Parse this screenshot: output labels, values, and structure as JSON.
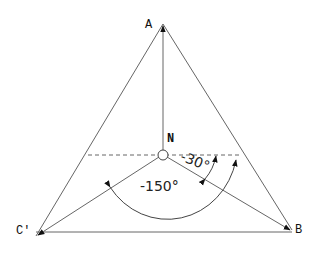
{
  "diagram": {
    "type": "vector-diagram",
    "points": {
      "A": {
        "label": "A",
        "x": 163,
        "y": 24
      },
      "B": {
        "label": "B",
        "x": 292,
        "y": 230
      },
      "C": {
        "label": "C'",
        "x": 36,
        "y": 236
      },
      "N": {
        "label": "N",
        "x": 163,
        "y": 155
      }
    },
    "angles": {
      "small": {
        "label": "-30°"
      },
      "large": {
        "label": "-150°"
      }
    },
    "colors": {
      "line": "#555555",
      "text": "#111111",
      "background": "#ffffff"
    }
  }
}
